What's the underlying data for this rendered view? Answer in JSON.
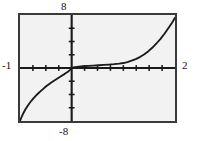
{
  "figure": {
    "kind": "graphing-calculator-plot",
    "background_color": "#ffffff",
    "plot_background_color": "#f2f2f2",
    "frame_color": "#3a3a3a",
    "curve_color": "#1a1a1a",
    "axis_color": "#1a1a1a"
  },
  "labels": {
    "y_max": "8",
    "y_min": "-8",
    "x_min": "-1",
    "x_max": "2"
  },
  "chart_data": {
    "type": "line",
    "title": "",
    "xlabel": "",
    "ylabel": "",
    "xlim": [
      -1,
      2
    ],
    "ylim": [
      -8,
      8
    ],
    "grid": false,
    "legend": "none",
    "x_ticks": [
      -0.75,
      -0.5,
      -0.25,
      0.25,
      0.5,
      0.75,
      1,
      1.25,
      1.5,
      1.75
    ],
    "y_ticks": [
      -6,
      -4,
      -2,
      2,
      4,
      6
    ],
    "tick_labels_visible": false,
    "axis_labels_outside": {
      "top": "8",
      "bottom": "-8",
      "left": "-1",
      "right": "2"
    },
    "series": [
      {
        "name": "curve",
        "x": [
          -1.0,
          -0.97,
          -0.94,
          -0.9,
          -0.86,
          -0.82,
          -0.78,
          -0.74,
          -0.7,
          -0.65,
          -0.6,
          -0.55,
          -0.5,
          -0.44,
          -0.38,
          -0.32,
          -0.26,
          -0.2,
          -0.14,
          -0.08,
          -0.02,
          0.0,
          0.06,
          0.14,
          0.22,
          0.32,
          0.42,
          0.52,
          0.62,
          0.72,
          0.82,
          0.92,
          1.0,
          1.08,
          1.16,
          1.24,
          1.32,
          1.4,
          1.48,
          1.56,
          1.64,
          1.72,
          1.8,
          1.88,
          1.94,
          2.0
        ],
        "y": [
          -8.0,
          -7.4,
          -6.9,
          -6.3,
          -5.8,
          -5.35,
          -4.95,
          -4.6,
          -4.25,
          -3.85,
          -3.5,
          -3.15,
          -2.8,
          -2.45,
          -2.1,
          -1.8,
          -1.5,
          -1.2,
          -0.92,
          -0.62,
          -0.2,
          0.0,
          0.12,
          0.2,
          0.26,
          0.32,
          0.37,
          0.42,
          0.47,
          0.52,
          0.58,
          0.66,
          0.75,
          0.9,
          1.1,
          1.35,
          1.65,
          2.05,
          2.5,
          3.05,
          3.7,
          4.4,
          5.2,
          6.1,
          6.8,
          7.6
        ]
      }
    ]
  }
}
